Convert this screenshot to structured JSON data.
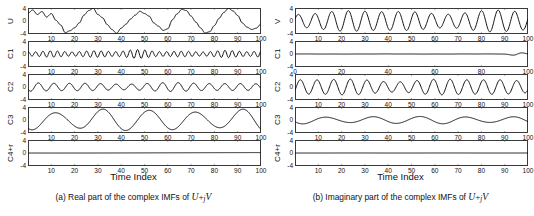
{
  "figure": {
    "xaxis_title": "Time Index"
  },
  "subfigures": [
    {
      "id": "a",
      "caption_prefix": "(a) Real part of the complex IMFs of ",
      "caption_math_u": "U",
      "caption_math_op": "+",
      "caption_math_j": "j",
      "caption_math_v": "V",
      "xaxis_title": "Time Index",
      "panels": [
        {
          "label": "U",
          "yticks": [
            "4",
            "0",
            "-4"
          ],
          "ylim": [
            -4,
            4
          ],
          "xlim": [
            0,
            100
          ],
          "xticks": [
            10,
            20,
            30,
            40,
            50,
            60,
            70,
            80,
            90,
            100
          ],
          "xticklabels": [
            "10",
            "20",
            "30",
            "40",
            "50",
            "60",
            "70",
            "80",
            "90",
            "100"
          ]
        },
        {
          "label": "C1",
          "yticks": [
            "4",
            "0",
            "-4"
          ],
          "ylim": [
            -4,
            4
          ],
          "xlim": [
            0,
            100
          ],
          "xticks": [
            10,
            20,
            30,
            40,
            50,
            60,
            70,
            80,
            90,
            100
          ],
          "xticklabels": [
            "10",
            "20",
            "30",
            "40",
            "50",
            "60",
            "70",
            "80",
            "90",
            "100"
          ]
        },
        {
          "label": "C2",
          "yticks": [
            "4",
            "0",
            "-4"
          ],
          "ylim": [
            -4,
            4
          ],
          "xlim": [
            0,
            100
          ],
          "xticks": [
            10,
            20,
            30,
            40,
            50,
            60,
            70,
            80,
            90,
            100
          ],
          "xticklabels": [
            "10",
            "20",
            "30",
            "40",
            "50",
            "60",
            "70",
            "80",
            "90",
            "100"
          ]
        },
        {
          "label": "C3",
          "yticks": [
            "4",
            "0",
            "-4"
          ],
          "ylim": [
            -4,
            4
          ],
          "xlim": [
            0,
            100
          ],
          "xticks": [
            10,
            20,
            30,
            40,
            50,
            60,
            70,
            80,
            90,
            100
          ],
          "xticklabels": [
            "10",
            "20",
            "30",
            "40",
            "50",
            "60",
            "70",
            "80",
            "90",
            "100"
          ]
        },
        {
          "label": "C4+r",
          "yticks": [
            "4",
            "0",
            "-4"
          ],
          "ylim": [
            -4,
            4
          ],
          "xlim": [
            0,
            100
          ],
          "xticks": [
            10,
            20,
            30,
            40,
            50,
            60,
            70,
            80,
            90,
            100
          ],
          "xticklabels": [
            "10",
            "20",
            "30",
            "40",
            "50",
            "60",
            "70",
            "80",
            "90",
            "100"
          ]
        }
      ]
    },
    {
      "id": "b",
      "caption_prefix": "(b) Imaginary part of the complex IMFs of ",
      "caption_math_u": "U",
      "caption_math_op": "+",
      "caption_math_j": "j",
      "caption_math_v": "V",
      "xaxis_title": "Time Index",
      "panels": [
        {
          "label": "V",
          "yticks": [
            "4",
            "0",
            "-4"
          ],
          "ylim": [
            -4,
            4
          ],
          "xlim": [
            0,
            100
          ],
          "xticks": [
            10,
            20,
            30,
            40,
            50,
            60,
            70,
            80,
            90,
            100
          ],
          "xticklabels": [
            "10",
            "20",
            "30",
            "40",
            "50",
            "60",
            "70",
            "80",
            "90",
            "100"
          ]
        },
        {
          "label": "C1",
          "yticks": [
            "4",
            "0",
            "-4"
          ],
          "ylim": [
            -4,
            4
          ],
          "xlim": [
            0,
            100
          ],
          "xticks": [
            0,
            20,
            40,
            60,
            80,
            100
          ],
          "xticklabels": [
            "0",
            "20",
            "40",
            "60",
            "80",
            "100"
          ]
        },
        {
          "label": "C2",
          "yticks": [
            "4",
            "0",
            "-4"
          ],
          "ylim": [
            -4,
            4
          ],
          "xlim": [
            0,
            100
          ],
          "xticks": [
            10,
            20,
            30,
            40,
            50,
            60,
            70,
            80,
            90,
            100
          ],
          "xticklabels": [
            "10",
            "20",
            "30",
            "40",
            "50",
            "60",
            "70",
            "80",
            "90",
            "100"
          ]
        },
        {
          "label": "C3",
          "yticks": [
            "4",
            "0",
            "-4"
          ],
          "ylim": [
            -4,
            4
          ],
          "xlim": [
            0,
            100
          ],
          "xticks": [
            10,
            20,
            30,
            40,
            50,
            60,
            70,
            80,
            90,
            100
          ],
          "xticklabels": [
            "10",
            "20",
            "30",
            "40",
            "50",
            "60",
            "70",
            "80",
            "90",
            "100"
          ]
        },
        {
          "label": "C4+r",
          "yticks": [
            "4",
            "0",
            "-4"
          ],
          "ylim": [
            -4,
            4
          ],
          "xlim": [
            0,
            100
          ],
          "xticks": [
            10,
            20,
            30,
            40,
            50,
            60,
            70,
            80,
            90,
            100
          ],
          "xticklabels": [
            "10",
            "20",
            "30",
            "40",
            "50",
            "60",
            "70",
            "80",
            "90",
            "100"
          ]
        }
      ]
    }
  ],
  "chart_data": {
    "type": "line",
    "title": "",
    "xlabel": "Time Index",
    "ylabel": "",
    "xlim": [
      0,
      100
    ],
    "ylim": [
      -4,
      4
    ],
    "grid": false,
    "legend": "none",
    "series": [
      {
        "name": "a.U",
        "subfigure": "a",
        "panel": "U",
        "description": "Composite noisy signal, sum of C1+C2+C3+C4+r",
        "x": [
          0,
          2,
          4,
          6,
          8,
          10,
          12,
          14,
          16,
          18,
          20,
          22,
          24,
          26,
          28,
          30,
          32,
          34,
          36,
          38,
          40,
          42,
          44,
          46,
          48,
          50,
          52,
          54,
          56,
          58,
          60,
          62,
          64,
          66,
          68,
          70,
          72,
          74,
          76,
          78,
          80,
          82,
          84,
          86,
          88,
          90,
          92,
          94,
          96,
          98,
          100
        ],
        "values": [
          2.4,
          3.4,
          2.0,
          2.9,
          1.2,
          2.3,
          0.2,
          -1.2,
          -3.6,
          -3.0,
          -2.1,
          -0.6,
          1.8,
          3.2,
          3.9,
          2.0,
          1.0,
          -1.1,
          -2.6,
          -3.8,
          -2.2,
          -1.0,
          0.6,
          1.8,
          3.0,
          2.3,
          1.5,
          -0.6,
          -1.6,
          -2.9,
          -2.4,
          0.4,
          2.2,
          3.6,
          3.2,
          1.5,
          -0.3,
          -2.1,
          -3.7,
          -3.3,
          -1.4,
          0.8,
          2.6,
          3.9,
          3.1,
          1.7,
          -0.6,
          -1.9,
          -2.6,
          -2.2,
          -0.9
        ]
      },
      {
        "name": "a.C1",
        "subfigure": "a",
        "panel": "C1",
        "description": "High-frequency IMF, ~32 cycles, amplitude ~0.9",
        "frequency_cycles": 32,
        "amplitude": 0.9
      },
      {
        "name": "a.C2",
        "subfigure": "a",
        "panel": "C2",
        "description": "Mid-frequency IMF, ~15 cycles, amplitude ~1.1",
        "frequency_cycles": 15,
        "amplitude": 1.1
      },
      {
        "name": "a.C3",
        "subfigure": "a",
        "panel": "C3",
        "description": "Low-frequency IMF, ~5 cycles, amplitude ~2.9",
        "frequency_cycles": 5,
        "amplitude": 2.9
      },
      {
        "name": "a.C4+r",
        "subfigure": "a",
        "panel": "C4+r",
        "description": "Residual, nearly flat near 0",
        "frequency_cycles": 0.5,
        "amplitude": 0.12
      },
      {
        "name": "b.V",
        "subfigure": "b",
        "panel": "V",
        "description": "Composite signal, ~14 cycles, amplitude modulated 2 to 3.2",
        "frequency_cycles": 14,
        "amplitude": 2.8
      },
      {
        "name": "b.C1",
        "subfigure": "b",
        "panel": "C1",
        "description": "Near-zero IMF with small bump near t=95",
        "frequency_cycles": 0,
        "amplitude": 0.12
      },
      {
        "name": "b.C2",
        "subfigure": "b",
        "panel": "C2",
        "description": "Mid-frequency IMF, ~14 cycles, amplitude ~2.1",
        "frequency_cycles": 14,
        "amplitude": 2.1
      },
      {
        "name": "b.C3",
        "subfigure": "b",
        "panel": "C3",
        "description": "Low-frequency IMF, ~5 cycles, amplitude ~1.0",
        "frequency_cycles": 5,
        "amplitude": 1.0
      },
      {
        "name": "b.C4+r",
        "subfigure": "b",
        "panel": "C4+r",
        "description": "Residual, flat at 0",
        "frequency_cycles": 0,
        "amplitude": 0.03
      }
    ]
  }
}
